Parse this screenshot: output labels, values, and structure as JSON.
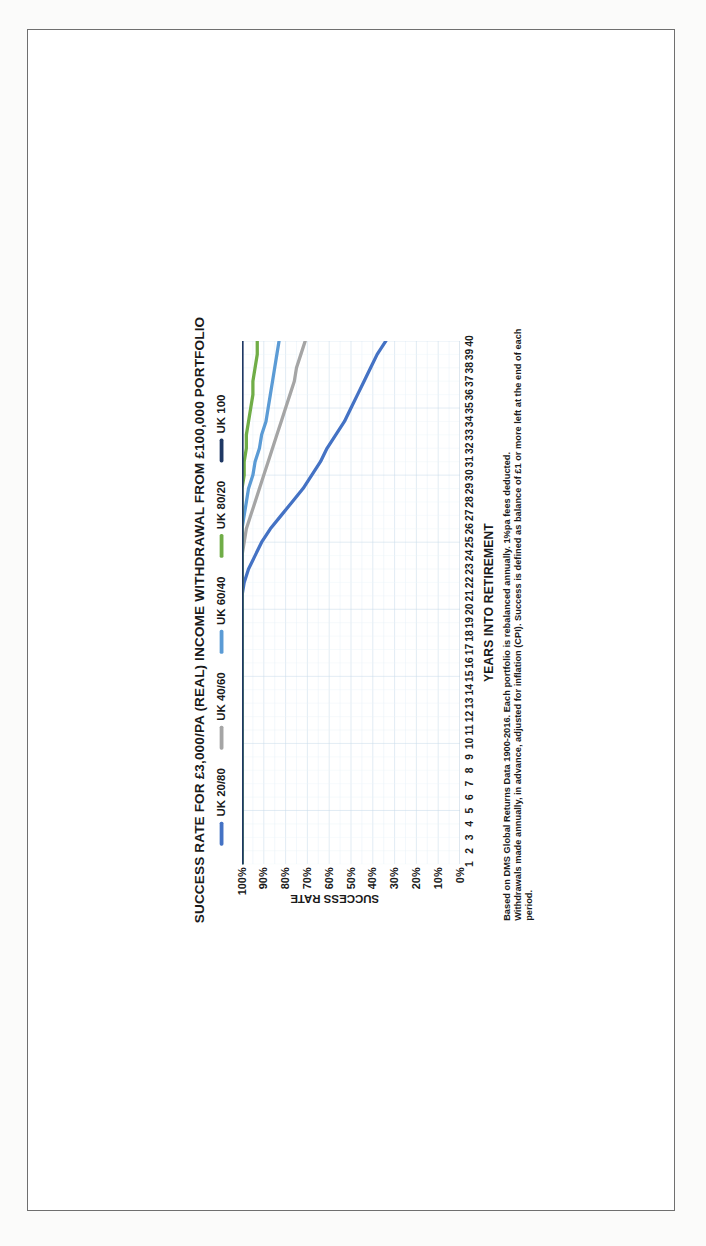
{
  "chart_data": {
    "type": "line",
    "title": "SUCCESS RATE FOR £3,000/PA (REAL) INCOME WITHDRAWAL FROM £100,000 PORTFOLIO",
    "xlabel": "YEARS INTO RETIREMENT",
    "ylabel": "SUCCESS RATE",
    "xlim": [
      1,
      40
    ],
    "ylim": [
      0,
      100
    ],
    "grid": true,
    "legend_position": "top",
    "x": [
      1,
      2,
      3,
      4,
      5,
      6,
      7,
      8,
      9,
      10,
      11,
      12,
      13,
      14,
      15,
      16,
      17,
      18,
      19,
      20,
      21,
      22,
      23,
      24,
      25,
      26,
      27,
      28,
      29,
      30,
      31,
      32,
      33,
      34,
      35,
      36,
      37,
      38,
      39,
      40
    ],
    "xtick_labels": [
      "1",
      "2",
      "3",
      "4",
      "5",
      "6",
      "7",
      "8",
      "9",
      "10",
      "11",
      "12",
      "13",
      "14",
      "15",
      "16",
      "17",
      "18",
      "19",
      "20",
      "21",
      "22",
      "23",
      "24",
      "25",
      "26",
      "27",
      "28",
      "29",
      "30",
      "31",
      "32",
      "33",
      "34",
      "35",
      "36",
      "37",
      "38",
      "39",
      "40"
    ],
    "ytick_labels": [
      "0%",
      "10%",
      "20%",
      "30%",
      "40%",
      "50%",
      "60%",
      "70%",
      "80%",
      "90%",
      "100%"
    ],
    "ytick_values": [
      0,
      10,
      20,
      30,
      40,
      50,
      60,
      70,
      80,
      90,
      100
    ],
    "series": [
      {
        "name": "UK 20/80",
        "color": "#4472C4",
        "values": [
          100,
          100,
          100,
          100,
          100,
          100,
          100,
          100,
          100,
          100,
          100,
          100,
          100,
          100,
          100,
          100,
          100,
          100,
          100,
          100,
          100,
          99,
          97,
          94,
          91,
          87,
          82,
          77,
          72,
          68,
          64,
          61,
          57,
          53,
          50,
          47,
          44,
          41,
          38,
          34
        ]
      },
      {
        "name": "UK 40/60",
        "color": "#A5A5A5",
        "values": [
          100,
          100,
          100,
          100,
          100,
          100,
          100,
          100,
          100,
          100,
          100,
          100,
          100,
          100,
          100,
          100,
          100,
          100,
          100,
          100,
          100,
          100,
          100,
          100,
          99,
          98,
          96,
          94,
          92,
          90,
          88,
          86,
          84,
          82,
          80,
          78,
          76,
          75,
          73,
          71
        ]
      },
      {
        "name": "UK 60/40",
        "color": "#5B9BD5",
        "values": [
          100,
          100,
          100,
          100,
          100,
          100,
          100,
          100,
          100,
          100,
          100,
          100,
          100,
          100,
          100,
          100,
          100,
          100,
          100,
          100,
          100,
          100,
          100,
          100,
          100,
          100,
          99,
          98,
          97,
          95,
          94,
          92,
          91,
          89,
          88,
          87,
          86,
          85,
          84,
          83
        ]
      },
      {
        "name": "UK 80/20",
        "color": "#70AD47",
        "values": [
          100,
          100,
          100,
          100,
          100,
          100,
          100,
          100,
          100,
          100,
          100,
          100,
          100,
          100,
          100,
          100,
          100,
          100,
          100,
          100,
          100,
          100,
          100,
          100,
          100,
          100,
          100,
          100,
          100,
          99,
          99,
          98,
          98,
          97,
          96,
          95,
          95,
          94,
          93,
          93
        ]
      },
      {
        "name": "UK 100",
        "color": "#1F3864",
        "values": [
          100,
          100,
          100,
          100,
          100,
          100,
          100,
          100,
          100,
          100,
          100,
          100,
          100,
          100,
          100,
          100,
          100,
          100,
          100,
          100,
          100,
          100,
          100,
          100,
          100,
          100,
          100,
          100,
          100,
          100,
          100,
          100,
          100,
          100,
          100,
          100,
          100,
          100,
          100,
          100
        ]
      }
    ],
    "footnotes": [
      "Based on DMS Global Returns Data 1900-2016. Each portfolio is rebalanced annually. 1%pa fees deducted.",
      "Withdrawals made annually, in advance, adjusted for inflation (CPI). Success is defined as balance of £1 or more left at the end of each period."
    ]
  }
}
